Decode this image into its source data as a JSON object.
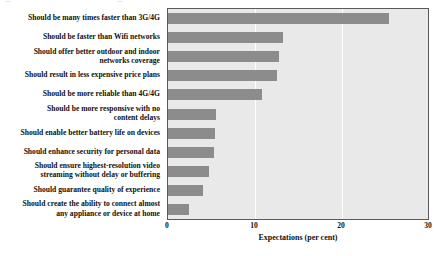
{
  "chart_data": {
    "type": "bar",
    "orientation": "horizontal",
    "title": "",
    "xlabel": "Expectations (per cent)",
    "ylabel": "",
    "xlim": [
      0,
      30
    ],
    "xticks": [
      0,
      10,
      20,
      30
    ],
    "grid": "vertical-white-at-10-20",
    "legend": "none",
    "bar_color": "#8c8c8c",
    "plot_background": "#e9e9e9",
    "categories": [
      "Should be many times faster than 3G/4G",
      "Should be faster than Wifi networks",
      "Should offer better outdoor and indoor\nnetworks coverage",
      "Should result in less expensive price plans",
      "Should be more reliable than 4G/4G",
      "Should be more responsive with no\ncontent delays",
      "Should enable better battery life on devices",
      "Should enhance security for personal data",
      "Should ensure highest-resolution video\nstreaming without delay or buffering",
      "Should guarantee quality of experience",
      "Should create the ability to connect almost\nany appliance or device at home"
    ],
    "values": [
      25.5,
      13.3,
      12.8,
      12.6,
      10.8,
      5.5,
      5.4,
      5.3,
      4.7,
      4.0,
      2.4
    ]
  },
  "axis": {
    "tick_0": "0",
    "tick_1": "10",
    "tick_2": "20",
    "tick_3": "30",
    "x_title": "Expectations (per cent)"
  },
  "labels": {
    "row0": "Should be many times faster than 3G/4G",
    "row1": "Should be faster than Wifi networks",
    "row2": "Should offer better outdoor and indoor\nnetworks coverage",
    "row3": "Should result in less expensive price plans",
    "row4": "Should be more reliable than 4G/4G",
    "row5": "Should be more responsive with no\ncontent delays",
    "row6": "Should enable better battery life on devices",
    "row7": "Should enhance security for personal data",
    "row8": "Should ensure highest-resolution video\nstreaming without delay or buffering",
    "row9": "Should guarantee quality of experience",
    "row10": "Should create the ability to connect almost\nany appliance or device at home"
  }
}
